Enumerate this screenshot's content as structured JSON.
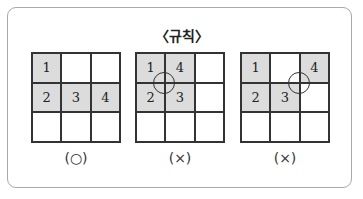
{
  "title": "〈규칙〉",
  "colors": {
    "filled": "#dcdcdc",
    "line": "#333333",
    "frame": "#a9a9a9"
  },
  "examples": [
    {
      "verdict": "(○)",
      "cells": [
        "1",
        "",
        "",
        "2",
        "3",
        "4",
        "",
        "",
        ""
      ],
      "filled": [
        true,
        false,
        false,
        true,
        true,
        true,
        false,
        false,
        false
      ],
      "circle": null
    },
    {
      "verdict": "(×)",
      "cells": [
        "1",
        "4",
        "",
        "2",
        "3",
        "",
        "",
        "",
        ""
      ],
      "filled": [
        true,
        true,
        false,
        true,
        true,
        false,
        false,
        false,
        false
      ],
      "circle": "center of 1-4-2-3 block"
    },
    {
      "verdict": "(×)",
      "cells": [
        "1",
        "",
        "4",
        "2",
        "3",
        "",
        "",
        "",
        ""
      ],
      "filled": [
        true,
        false,
        true,
        true,
        true,
        false,
        false,
        false,
        false
      ],
      "circle": "corner between 3 and 4"
    }
  ]
}
